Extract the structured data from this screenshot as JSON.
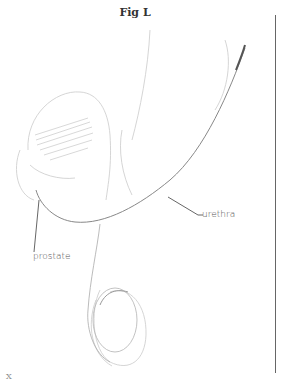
{
  "figure": {
    "title": "Fig L",
    "labels": {
      "urethra": "urethra",
      "prostate": "prostate"
    },
    "corner_fragment": "X"
  },
  "colors": {
    "ink": "#555555",
    "faint_ink": "#c8c8c8",
    "rule": "#666666"
  }
}
